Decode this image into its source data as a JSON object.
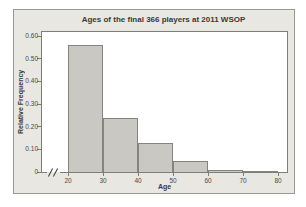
{
  "colors": {
    "figure_bg": "#e9e7e1",
    "figure_border": "#9a9a94",
    "plot_bg": "#ffffff",
    "axis_color": "#7d7d78",
    "bar_fill": "#c9c8c3",
    "bar_border": "#85857f",
    "text_color": "#3a3a3a",
    "tick_color": "#4a4a4a"
  },
  "chart_data": {
    "type": "bar",
    "title": "Ages of the final 366 players at 2011 WSOP",
    "xlabel": "Age",
    "ylabel": "Relative Frequency",
    "bins": [
      {
        "x0": 20,
        "x1": 30,
        "value": 0.56
      },
      {
        "x0": 30,
        "x1": 40,
        "value": 0.24
      },
      {
        "x0": 40,
        "x1": 50,
        "value": 0.13
      },
      {
        "x0": 50,
        "x1": 60,
        "value": 0.05
      },
      {
        "x0": 60,
        "x1": 70,
        "value": 0.01
      },
      {
        "x0": 70,
        "x1": 80,
        "value": 0.003
      }
    ],
    "xticks": [
      20,
      30,
      40,
      50,
      60,
      70,
      80
    ],
    "yticks": [
      {
        "value": 0.0,
        "label": "0"
      },
      {
        "value": 0.1,
        "label": "0.10"
      },
      {
        "value": 0.2,
        "label": "0.20"
      },
      {
        "value": 0.3,
        "label": "0.30"
      },
      {
        "value": 0.4,
        "label": "0.40"
      },
      {
        "value": 0.5,
        "label": "0.50"
      },
      {
        "value": 0.6,
        "label": "0.60"
      }
    ],
    "ylim": [
      0,
      0.6
    ],
    "grid": false,
    "legend": false,
    "axis_break_on_x": true
  }
}
